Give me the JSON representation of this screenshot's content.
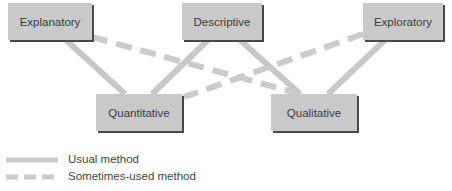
{
  "nodes": {
    "explanatory": {
      "label": "Explanatory"
    },
    "descriptive": {
      "label": "Descriptive"
    },
    "exploratory": {
      "label": "Exploratory"
    },
    "quantitative": {
      "label": "Quantitative"
    },
    "qualitative": {
      "label": "Qualitative"
    }
  },
  "edges": [
    {
      "from": "explanatory",
      "to": "quantitative",
      "type": "usual"
    },
    {
      "from": "descriptive",
      "to": "quantitative",
      "type": "usual"
    },
    {
      "from": "descriptive",
      "to": "qualitative",
      "type": "usual"
    },
    {
      "from": "exploratory",
      "to": "qualitative",
      "type": "usual"
    },
    {
      "from": "explanatory",
      "to": "qualitative",
      "type": "sometimes"
    },
    {
      "from": "exploratory",
      "to": "quantitative",
      "type": "sometimes"
    }
  ],
  "legend": {
    "usual": "Usual method",
    "sometimes": "Sometimes-used method"
  },
  "colors": {
    "box_fill": "#c9c9c9",
    "box_shadow": "#4a4a4a",
    "line": "#c8c8c8"
  }
}
